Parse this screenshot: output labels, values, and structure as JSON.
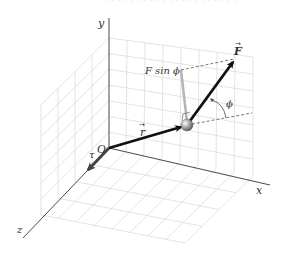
{
  "figure": {
    "type": "3d-torque-diagram",
    "top_caption_faint": "· · · · · · · · · · · · · · · · · · · · ·",
    "axes": {
      "x_label": "x",
      "y_label": "y",
      "z_label": "z",
      "origin_label": "O"
    },
    "vectors": {
      "r_label": "r",
      "F_label": "F",
      "tau_label": "τ",
      "arrow_accent": "→"
    },
    "annotations": {
      "f_sin_phi": "F sin ϕ",
      "phi": "ϕ"
    },
    "colors": {
      "grid": "#d9d9d9",
      "axis": "#333333",
      "vector": "#111111",
      "tau_vector": "#444444",
      "perp_component": "#b5b5b5",
      "particle": "#9a9a9a",
      "dashed": "#555555"
    }
  }
}
